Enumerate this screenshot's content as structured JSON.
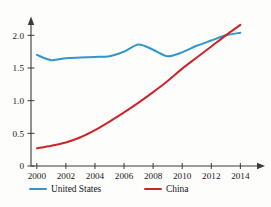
{
  "chart_data": {
    "type": "line",
    "title": "",
    "subtitle": "",
    "xlabel": "",
    "ylabel": "",
    "x": [
      2000,
      2001,
      2002,
      2003,
      2004,
      2005,
      2006,
      2007,
      2008,
      2009,
      2010,
      2011,
      2012,
      2013,
      2014
    ],
    "xlim": [
      1999.6,
      2014.8
    ],
    "ylim": [
      0,
      2.25
    ],
    "xticks": [
      2000,
      2002,
      2004,
      2006,
      2008,
      2010,
      2012,
      2014
    ],
    "xtick_labels": [
      "2000",
      "2002",
      "2004",
      "2006",
      "2008",
      "2010",
      "2012",
      "2014"
    ],
    "yticks": [
      0,
      0.5,
      1.0,
      1.5,
      2.0
    ],
    "ytick_labels": [
      "0",
      "0.5",
      "1.0",
      "1.5",
      "2.0"
    ],
    "grid": false,
    "legend_position": "bottom-left",
    "series": [
      {
        "name": "United States",
        "color": "#3196cc",
        "values": [
          1.7,
          1.62,
          1.65,
          1.66,
          1.67,
          1.68,
          1.75,
          1.86,
          1.78,
          1.68,
          1.74,
          1.84,
          1.92,
          2.0,
          2.04
        ]
      },
      {
        "name": "China",
        "color": "#cb252c",
        "values": [
          0.27,
          0.31,
          0.36,
          0.44,
          0.55,
          0.68,
          0.82,
          0.97,
          1.13,
          1.3,
          1.49,
          1.66,
          1.83,
          2.0,
          2.16
        ]
      }
    ]
  },
  "legend": {
    "items": [
      {
        "label": "United States",
        "color": "#3196cc"
      },
      {
        "label": "China",
        "color": "#cb252c"
      }
    ]
  },
  "axes": {
    "x_axis_name": "year-axis",
    "y_axis_name": "value-axis"
  },
  "colors": {
    "united_states": "#3196cc",
    "china": "#cb252c",
    "axis": "#3a3a3a",
    "background": "#fdfdfb"
  }
}
